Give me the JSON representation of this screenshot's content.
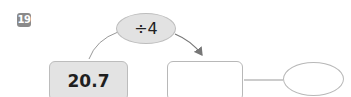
{
  "problem": {
    "number": "19",
    "operation": "÷4",
    "start_value": "20.7",
    "answer_box": "",
    "answer_ellipse": ""
  },
  "colors": {
    "badge": "#8a8a8a",
    "shaded_fill": "#e2e2e2",
    "border": "#bcbcbc",
    "arrow": "#777777"
  }
}
